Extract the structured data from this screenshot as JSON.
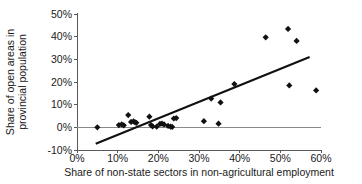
{
  "chart_data": {
    "type": "scatter",
    "title": "",
    "xlabel": "Share of non-state sectors in non-agricultural employment",
    "ylabel": "Share of open areas in provincial population",
    "xlim": [
      0,
      60
    ],
    "ylim": [
      -10,
      50
    ],
    "grid": false,
    "legend": "none",
    "x_tick_labels": [
      "0%",
      "10%",
      "20%",
      "30%",
      "40%",
      "50%",
      "60%"
    ],
    "x_ticks": [
      0,
      10,
      20,
      30,
      40,
      50,
      60
    ],
    "y_tick_labels": [
      "-10%",
      "0%",
      "10%",
      "20%",
      "30%",
      "40%",
      "50%"
    ],
    "y_ticks": [
      -10,
      0,
      10,
      20,
      30,
      40,
      50
    ],
    "marker_shape": "diamond",
    "marker_color": "#111111",
    "series": [
      {
        "name": "Provinces",
        "points": [
          [
            5.0,
            0.0
          ],
          [
            10.3,
            1.0
          ],
          [
            11.0,
            1.3
          ],
          [
            11.5,
            0.9
          ],
          [
            12.6,
            5.4
          ],
          [
            13.3,
            2.4
          ],
          [
            13.9,
            2.6
          ],
          [
            14.3,
            2.2
          ],
          [
            14.6,
            2.0
          ],
          [
            17.8,
            4.7
          ],
          [
            18.2,
            1.0
          ],
          [
            18.6,
            0.4
          ],
          [
            19.6,
            0.3
          ],
          [
            20.4,
            1.5
          ],
          [
            20.9,
            1.6
          ],
          [
            21.4,
            1.3
          ],
          [
            22.4,
            0.6
          ],
          [
            23.0,
            0.3
          ],
          [
            23.4,
            0.2
          ],
          [
            23.8,
            3.9
          ],
          [
            24.4,
            4.1
          ],
          [
            31.2,
            2.7
          ],
          [
            33.0,
            12.7
          ],
          [
            34.8,
            1.6
          ],
          [
            35.3,
            11.0
          ],
          [
            38.7,
            19.1
          ],
          [
            46.4,
            39.7
          ],
          [
            51.9,
            43.4
          ],
          [
            52.2,
            18.5
          ],
          [
            54.0,
            38.1
          ],
          [
            58.8,
            16.3
          ]
        ]
      }
    ],
    "trendline": {
      "type": "linear",
      "x_start": 4.6,
      "y_start": -7.2,
      "x_end": 57.2,
      "y_end": 31.0
    }
  }
}
